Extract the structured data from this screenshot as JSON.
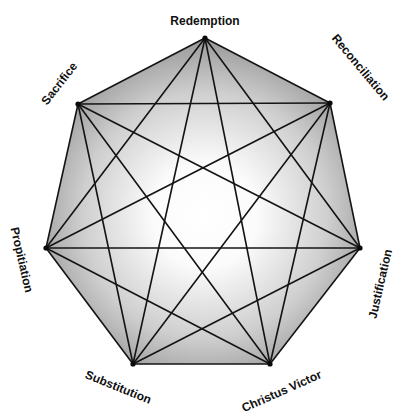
{
  "diagram": {
    "type": "complete-graph-heptagon",
    "colors": {
      "line": "#141414",
      "gradient_center": "#ffffff",
      "gradient_edge": "#9a9a9a",
      "background": "#ffffff"
    },
    "nodes": [
      {
        "id": "redemption",
        "label": "Redemption",
        "x": 205,
        "y": 38,
        "label_x": 205,
        "label_y": 22,
        "rotate": 0
      },
      {
        "id": "reconciliation",
        "label": "Reconciliation",
        "x": 330,
        "y": 103,
        "label_x": 360,
        "label_y": 68,
        "rotate": 50
      },
      {
        "id": "justification",
        "label": "Justification",
        "x": 360,
        "y": 248,
        "label_x": 381,
        "label_y": 284,
        "rotate": -77
      },
      {
        "id": "christus_victor",
        "label": "Christus Victor",
        "x": 270,
        "y": 364,
        "label_x": 282,
        "label_y": 392,
        "rotate": -24
      },
      {
        "id": "substitution",
        "label": "Substitution",
        "x": 133,
        "y": 364,
        "label_x": 118,
        "label_y": 388,
        "rotate": 22
      },
      {
        "id": "propitiation",
        "label": "Propitiation",
        "x": 46,
        "y": 248,
        "label_x": 21,
        "label_y": 260,
        "rotate": 77
      },
      {
        "id": "sacrifice",
        "label": "Sacrifice",
        "x": 78,
        "y": 104,
        "label_x": 60,
        "label_y": 84,
        "rotate": -52
      }
    ],
    "edges": "all-pairs (21 edges)"
  }
}
